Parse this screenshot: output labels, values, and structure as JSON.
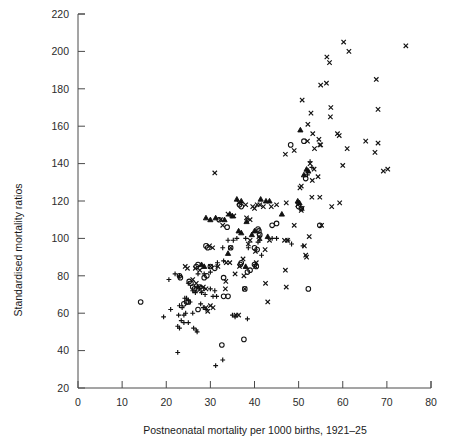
{
  "chart_data": {
    "type": "scatter",
    "title": "",
    "xlabel": "Postneonatal mortality per 1000 births, 1921–25",
    "ylabel": "Standardised mortality ratios",
    "xlim": [
      0,
      80
    ],
    "ylim": [
      20,
      220
    ],
    "xticks": [
      0,
      10,
      20,
      30,
      40,
      50,
      60,
      70,
      80
    ],
    "yticks": [
      20,
      40,
      60,
      80,
      100,
      120,
      140,
      160,
      180,
      200,
      220
    ],
    "xtick_labels": [
      "0",
      "10",
      "20",
      "30",
      "40",
      "50",
      "60",
      "70",
      "80"
    ],
    "ytick_labels": [
      "20",
      "40",
      "60",
      "80",
      "100",
      "120",
      "140",
      "160",
      "180",
      "200",
      "220"
    ],
    "grid": false,
    "legend": "none",
    "marker_color": "#111111",
    "series": [
      {
        "name": "cross",
        "marker": "x",
        "points": [
          [
            60.2,
            205
          ],
          [
            61.4,
            200
          ],
          [
            74.3,
            203
          ],
          [
            56.4,
            197
          ],
          [
            57.0,
            194
          ],
          [
            67.6,
            185
          ],
          [
            55.0,
            182
          ],
          [
            56.3,
            183
          ],
          [
            50.8,
            174
          ],
          [
            68.0,
            169
          ],
          [
            57.3,
            170
          ],
          [
            57.2,
            165
          ],
          [
            52.8,
            167
          ],
          [
            53.2,
            156
          ],
          [
            58.8,
            156
          ],
          [
            59.2,
            155
          ],
          [
            52.1,
            161
          ],
          [
            54.6,
            153
          ],
          [
            52.0,
            152
          ],
          [
            65.2,
            152
          ],
          [
            54.8,
            150
          ],
          [
            55.0,
            150
          ],
          [
            53.6,
            148
          ],
          [
            61.0,
            148
          ],
          [
            68.0,
            151
          ],
          [
            67.3,
            146
          ],
          [
            49.0,
            147
          ],
          [
            47.0,
            145
          ],
          [
            60.0,
            139
          ],
          [
            69.2,
            136
          ],
          [
            70.2,
            137
          ],
          [
            52.6,
            140
          ],
          [
            53.5,
            137
          ],
          [
            31.0,
            135
          ],
          [
            54.4,
            133
          ],
          [
            53.1,
            131
          ],
          [
            50.6,
            128
          ],
          [
            50.3,
            127
          ],
          [
            54.8,
            122
          ],
          [
            53.0,
            122
          ],
          [
            57.5,
            117
          ],
          [
            59.3,
            119
          ],
          [
            47.2,
            119
          ],
          [
            45.0,
            118
          ],
          [
            42.0,
            117
          ],
          [
            43.8,
            117
          ],
          [
            49.8,
            118
          ],
          [
            50.8,
            116
          ],
          [
            50.6,
            115
          ],
          [
            41.2,
            118
          ],
          [
            39.6,
            117
          ],
          [
            40.6,
            118
          ],
          [
            40.0,
            116
          ],
          [
            36.5,
            119
          ],
          [
            38.0,
            118
          ],
          [
            34.0,
            113
          ],
          [
            35.3,
            112
          ],
          [
            32.3,
            110
          ],
          [
            32.8,
            107
          ],
          [
            38.2,
            111
          ],
          [
            39.0,
            110
          ],
          [
            49.0,
            107
          ],
          [
            55.2,
            107
          ],
          [
            52.4,
            101
          ],
          [
            46.8,
            99
          ],
          [
            47.5,
            99
          ],
          [
            43.4,
            99
          ],
          [
            41.0,
            101
          ],
          [
            41.2,
            100
          ],
          [
            39.0,
            99
          ],
          [
            38.6,
            97
          ],
          [
            42.4,
            94
          ],
          [
            40.2,
            93
          ],
          [
            34.6,
            95
          ],
          [
            30.5,
            95
          ],
          [
            29.8,
            96
          ],
          [
            51.3,
            96
          ],
          [
            51.8,
            90
          ],
          [
            51.6,
            91
          ],
          [
            37.4,
            89
          ],
          [
            40.4,
            87
          ],
          [
            40.2,
            85
          ],
          [
            36.6,
            85
          ],
          [
            33.6,
            87
          ],
          [
            34.4,
            87
          ],
          [
            31.7,
            85
          ],
          [
            30.0,
            85
          ],
          [
            24.3,
            85
          ],
          [
            24.8,
            84
          ],
          [
            26.6,
            84
          ],
          [
            27.6,
            83
          ],
          [
            47.0,
            83
          ],
          [
            35.6,
            81
          ],
          [
            37.6,
            80
          ],
          [
            33.5,
            77
          ],
          [
            26.0,
            78
          ],
          [
            26.8,
            76
          ],
          [
            27.4,
            74
          ],
          [
            28.4,
            74
          ],
          [
            29.0,
            73
          ],
          [
            42.5,
            76
          ],
          [
            47.2,
            74
          ],
          [
            37.8,
            73
          ],
          [
            33.4,
            73
          ],
          [
            30.0,
            64
          ],
          [
            30.6,
            63
          ],
          [
            29.0,
            63
          ],
          [
            29.4,
            61
          ],
          [
            43.0,
            66
          ],
          [
            35.8,
            59
          ],
          [
            36.4,
            59
          ]
        ]
      },
      {
        "name": "circle",
        "marker": "o",
        "points": [
          [
            48.2,
            150
          ],
          [
            51.2,
            152
          ],
          [
            51.6,
            132
          ],
          [
            32.0,
            110
          ],
          [
            33.8,
            106
          ],
          [
            36.6,
            118
          ],
          [
            37.0,
            117
          ],
          [
            40.8,
            105
          ],
          [
            41.0,
            104
          ],
          [
            41.2,
            102
          ],
          [
            40.0,
            95
          ],
          [
            40.6,
            94
          ],
          [
            29.4,
            95
          ],
          [
            29.0,
            96
          ],
          [
            34.6,
            95
          ],
          [
            44.0,
            107
          ],
          [
            45.0,
            108
          ],
          [
            50.0,
            117
          ],
          [
            50.6,
            116
          ],
          [
            54.8,
            107
          ],
          [
            23.0,
            80
          ],
          [
            23.2,
            79
          ],
          [
            25.2,
            77
          ],
          [
            25.6,
            76
          ],
          [
            26.0,
            74
          ],
          [
            26.4,
            73
          ],
          [
            27.0,
            73
          ],
          [
            27.6,
            74
          ],
          [
            28.0,
            73
          ],
          [
            28.6,
            79
          ],
          [
            29.2,
            80
          ],
          [
            31.0,
            84
          ],
          [
            30.0,
            85
          ],
          [
            36.8,
            86
          ],
          [
            37.0,
            87
          ],
          [
            40.0,
            86
          ],
          [
            40.4,
            85
          ],
          [
            33.0,
            69
          ],
          [
            34.0,
            69
          ],
          [
            37.8,
            73
          ],
          [
            24.0,
            65
          ],
          [
            24.6,
            66
          ],
          [
            25.0,
            66
          ],
          [
            14.2,
            66
          ],
          [
            27.2,
            62
          ],
          [
            32.6,
            43
          ],
          [
            37.6,
            46
          ],
          [
            52.2,
            73
          ],
          [
            33.0,
            79
          ],
          [
            26.8,
            85
          ],
          [
            27.2,
            86
          ],
          [
            38.4,
            82
          ],
          [
            39.0,
            83
          ]
        ]
      },
      {
        "name": "plus",
        "marker": "+",
        "points": [
          [
            52.6,
            141
          ],
          [
            53.0,
            138
          ],
          [
            52.0,
            134
          ],
          [
            41.2,
            99
          ],
          [
            40.8,
            98
          ],
          [
            35.2,
            99
          ],
          [
            36.0,
            100
          ],
          [
            34.0,
            99
          ],
          [
            47.6,
            99
          ],
          [
            48.4,
            97
          ],
          [
            51.0,
            96
          ],
          [
            38.0,
            100
          ],
          [
            32.8,
            95
          ],
          [
            38.6,
            95
          ],
          [
            31.6,
            87
          ],
          [
            33.0,
            88
          ],
          [
            30.0,
            82
          ],
          [
            28.6,
            81
          ],
          [
            27.2,
            81
          ],
          [
            22.0,
            81
          ],
          [
            23.0,
            80
          ],
          [
            20.6,
            78
          ],
          [
            25.0,
            76
          ],
          [
            26.0,
            72
          ],
          [
            26.6,
            71
          ],
          [
            28.0,
            71
          ],
          [
            28.8,
            70
          ],
          [
            30.6,
            69
          ],
          [
            31.4,
            69
          ],
          [
            24.2,
            68
          ],
          [
            24.6,
            68
          ],
          [
            25.0,
            67
          ],
          [
            25.4,
            66
          ],
          [
            23.0,
            64
          ],
          [
            23.6,
            63
          ],
          [
            21.0,
            62
          ],
          [
            27.8,
            65
          ],
          [
            28.4,
            63
          ],
          [
            29.0,
            62
          ],
          [
            26.0,
            60
          ],
          [
            24.4,
            60
          ],
          [
            24.0,
            59
          ],
          [
            22.8,
            59
          ],
          [
            19.4,
            58
          ],
          [
            23.4,
            56
          ],
          [
            24.0,
            55
          ],
          [
            25.0,
            55
          ],
          [
            22.6,
            53
          ],
          [
            23.0,
            52
          ],
          [
            26.2,
            52
          ],
          [
            26.8,
            51
          ],
          [
            27.0,
            50
          ],
          [
            35.0,
            59
          ],
          [
            35.6,
            58
          ],
          [
            38.4,
            57
          ],
          [
            32.8,
            35
          ],
          [
            31.2,
            32
          ],
          [
            22.6,
            39
          ],
          [
            44.0,
            100
          ],
          [
            45.0,
            100
          ],
          [
            30.0,
            73
          ],
          [
            31.0,
            72
          ],
          [
            41.6,
            91
          ]
        ]
      },
      {
        "name": "triangle",
        "marker": "^",
        "points": [
          [
            50.4,
            158
          ],
          [
            51.8,
            137
          ],
          [
            52.2,
            136
          ],
          [
            51.2,
            134
          ],
          [
            36.0,
            121
          ],
          [
            37.0,
            120
          ],
          [
            41.4,
            121
          ],
          [
            42.6,
            120
          ],
          [
            43.4,
            120
          ],
          [
            49.8,
            120
          ],
          [
            50.2,
            119
          ],
          [
            34.4,
            113
          ],
          [
            35.0,
            112
          ],
          [
            38.2,
            109
          ],
          [
            33.2,
            110
          ],
          [
            46.2,
            113
          ],
          [
            40.0,
            104
          ],
          [
            39.4,
            102
          ],
          [
            29.0,
            111
          ],
          [
            30.0,
            110
          ],
          [
            31.2,
            111
          ],
          [
            36.4,
            104
          ],
          [
            37.0,
            103
          ],
          [
            43.0,
            101
          ],
          [
            28.0,
            86
          ],
          [
            28.6,
            85
          ],
          [
            34.0,
            92
          ],
          [
            38.0,
            85
          ]
        ]
      }
    ]
  },
  "axes": {
    "y_axis_title": "Standardised mortality ratios",
    "x_axis_title": "Postneonatal mortality per 1000 births, 1921–25"
  }
}
